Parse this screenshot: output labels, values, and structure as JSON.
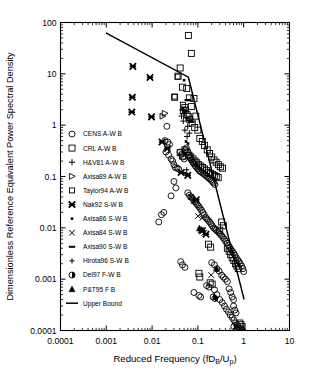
{
  "chart_data": {
    "type": "scatter",
    "title": "",
    "xlabel": "Reduced Frequency (fDB/Up)",
    "xlabel_main": "Reduced Frequency (fD",
    "xlabel_sub1": "B",
    "xlabel_mid": "/U",
    "xlabel_sub2": "p",
    "xlabel_end": ")",
    "ylabel": "Dimensionless Reference Equivalent Power Spectral Density",
    "xscale": "log",
    "yscale": "log",
    "xlim": [
      0.0001,
      10
    ],
    "ylim": [
      0.0001,
      100
    ],
    "grid": false,
    "legend_position": "inside-left",
    "xticks": [
      "0.0001",
      "0.001",
      "0.01",
      "0.1",
      "1",
      "10"
    ],
    "xtick_values": [
      0.0001,
      0.001,
      0.01,
      0.1,
      1,
      10
    ],
    "yticks": [
      "100",
      "10",
      "1",
      "0.1",
      "0.01",
      "0.001",
      "0.0001"
    ],
    "ytick_values": [
      100,
      10,
      1,
      0.1,
      0.01,
      0.001,
      0.0001
    ],
    "series": [
      {
        "name": "CENS A-W B",
        "marker": "circle-open",
        "points": [
          [
            0.021,
            0.95
          ],
          [
            0.019,
            0.5
          ],
          [
            0.022,
            0.47
          ],
          [
            0.024,
            0.42
          ],
          [
            0.02,
            0.3
          ],
          [
            0.023,
            0.26
          ],
          [
            0.026,
            0.22
          ],
          [
            0.028,
            0.2
          ],
          [
            0.03,
            0.17
          ],
          [
            0.032,
            0.15
          ],
          [
            0.035,
            0.145
          ],
          [
            0.038,
            0.14
          ],
          [
            0.041,
            0.3
          ],
          [
            0.044,
            0.27
          ],
          [
            0.047,
            0.24
          ],
          [
            0.05,
            0.22
          ],
          [
            0.053,
            0.33
          ],
          [
            0.056,
            0.36
          ],
          [
            0.06,
            0.3
          ],
          [
            0.064,
            0.26
          ],
          [
            0.068,
            0.23
          ],
          [
            0.072,
            0.21
          ],
          [
            0.077,
            0.19
          ],
          [
            0.082,
            0.175
          ],
          [
            0.088,
            0.16
          ],
          [
            0.094,
            0.15
          ],
          [
            0.1,
            0.14
          ],
          [
            0.107,
            0.13
          ],
          [
            0.114,
            0.125
          ],
          [
            0.122,
            0.12
          ],
          [
            0.13,
            0.115
          ],
          [
            0.139,
            0.11
          ],
          [
            0.148,
            0.105
          ],
          [
            0.158,
            0.1
          ],
          [
            0.169,
            0.095
          ],
          [
            0.181,
            0.09
          ],
          [
            0.193,
            0.085
          ],
          [
            0.206,
            0.08
          ],
          [
            0.22,
            0.075
          ],
          [
            0.235,
            0.07
          ],
          [
            0.03,
            0.08
          ],
          [
            0.033,
            0.06
          ],
          [
            0.026,
            0.042
          ],
          [
            0.018,
            0.02
          ],
          [
            0.016,
            0.018
          ],
          [
            0.014,
            0.013
          ],
          [
            0.06,
            0.048
          ],
          [
            0.065,
            0.043
          ],
          [
            0.07,
            0.04
          ],
          [
            0.075,
            0.038
          ],
          [
            0.08,
            0.035
          ],
          [
            0.086,
            0.032
          ],
          [
            0.092,
            0.03
          ],
          [
            0.098,
            0.028
          ],
          [
            0.105,
            0.026
          ],
          [
            0.112,
            0.024
          ],
          [
            0.12,
            0.022
          ],
          [
            0.128,
            0.02
          ],
          [
            0.137,
            0.018
          ],
          [
            0.147,
            0.016
          ],
          [
            0.157,
            0.015
          ],
          [
            0.168,
            0.014
          ],
          [
            0.18,
            0.013
          ],
          [
            0.193,
            0.012
          ],
          [
            0.206,
            0.011
          ],
          [
            0.22,
            0.01
          ],
          [
            0.236,
            0.0095
          ],
          [
            0.252,
            0.009
          ],
          [
            0.27,
            0.0085
          ],
          [
            0.288,
            0.008
          ],
          [
            0.308,
            0.0075
          ],
          [
            0.33,
            0.007
          ],
          [
            0.353,
            0.0065
          ],
          [
            0.377,
            0.006
          ],
          [
            0.403,
            0.0055
          ],
          [
            0.431,
            0.005
          ],
          [
            0.461,
            0.0046
          ],
          [
            0.493,
            0.0042
          ],
          [
            0.527,
            0.0038
          ],
          [
            0.564,
            0.0035
          ],
          [
            0.603,
            0.0032
          ],
          [
            0.645,
            0.0029
          ],
          [
            0.69,
            0.0026
          ],
          [
            0.737,
            0.0024
          ],
          [
            0.788,
            0.0022
          ],
          [
            0.843,
            0.002
          ],
          [
            0.901,
            0.0018
          ],
          [
            0.963,
            0.0016
          ],
          [
            1.0,
            0.0014
          ],
          [
            0.042,
            0.0022
          ],
          [
            0.046,
            0.0019
          ],
          [
            0.052,
            0.0017
          ],
          [
            0.082,
            0.00055
          ],
          [
            0.105,
            0.00048
          ],
          [
            0.115,
            0.00045
          ],
          [
            0.155,
            0.00075
          ],
          [
            0.175,
            0.0007
          ],
          [
            0.23,
            0.00062
          ],
          [
            0.26,
            0.0005
          ],
          [
            0.3,
            0.0004
          ],
          [
            0.34,
            0.00035
          ],
          [
            0.38,
            0.0003
          ],
          [
            0.42,
            0.00026
          ],
          [
            0.465,
            0.00023
          ],
          [
            0.51,
            0.0002
          ],
          [
            0.56,
            0.00018
          ],
          [
            0.61,
            0.00016
          ],
          [
            0.66,
            0.00014
          ],
          [
            0.71,
            0.00013
          ],
          [
            0.76,
            0.00012
          ],
          [
            0.81,
            0.00011
          ],
          [
            0.86,
            0.000105
          ],
          [
            0.91,
            0.0001
          ],
          [
            0.95,
            0.0001
          ],
          [
            0.6,
            0.0003
          ],
          [
            0.64,
            0.00025
          ],
          [
            0.68,
            0.00022
          ],
          [
            0.56,
            0.00045
          ],
          [
            0.6,
            0.0004
          ],
          [
            0.52,
            0.00055
          ],
          [
            0.48,
            0.00065
          ],
          [
            0.33,
            0.0012
          ],
          [
            0.36,
            0.0011
          ],
          [
            0.4,
            0.001
          ],
          [
            0.44,
            0.0009
          ],
          [
            0.26,
            0.0016
          ],
          [
            0.29,
            0.00145
          ],
          [
            0.2,
            0.0021
          ],
          [
            0.23,
            0.0019
          ]
        ]
      },
      {
        "name": "CRL A-W B",
        "marker": "square-open",
        "points": [
          [
            0.062,
            56
          ],
          [
            0.072,
            25
          ],
          [
            0.041,
            13
          ],
          [
            0.037,
            9.0
          ],
          [
            0.046,
            5.5
          ],
          [
            0.057,
            5.2
          ],
          [
            0.031,
            3.5
          ],
          [
            0.065,
            3.4
          ],
          [
            0.082,
            3.3
          ],
          [
            0.072,
            2.3
          ],
          [
            0.052,
            2.2
          ],
          [
            0.048,
            1.9
          ],
          [
            0.058,
            1.6
          ],
          [
            0.09,
            1.5
          ],
          [
            0.066,
            1.3
          ],
          [
            0.075,
            1.1
          ],
          [
            0.085,
            0.9
          ],
          [
            0.1,
            0.8
          ],
          [
            0.11,
            0.55
          ],
          [
            0.125,
            0.48
          ],
          [
            0.14,
            0.4
          ],
          [
            0.16,
            0.33
          ],
          [
            0.18,
            0.28
          ],
          [
            0.2,
            0.24
          ],
          [
            0.225,
            0.21
          ],
          [
            0.25,
            0.19
          ],
          [
            0.28,
            0.17
          ],
          [
            0.31,
            0.155
          ],
          [
            0.345,
            0.145
          ],
          [
            0.041,
            0.29
          ],
          [
            0.046,
            0.25
          ],
          [
            0.052,
            0.33
          ],
          [
            0.058,
            0.3
          ],
          [
            0.064,
            0.26
          ],
          [
            0.07,
            0.24
          ],
          [
            0.078,
            0.22
          ],
          [
            0.086,
            0.2
          ],
          [
            0.094,
            0.185
          ],
          [
            0.104,
            0.17
          ],
          [
            0.115,
            0.16
          ],
          [
            0.127,
            0.15
          ],
          [
            0.14,
            0.14
          ],
          [
            0.155,
            0.13
          ],
          [
            0.17,
            0.12
          ],
          [
            0.188,
            0.115
          ],
          [
            0.207,
            0.11
          ],
          [
            0.228,
            0.105
          ],
          [
            0.252,
            0.1
          ],
          [
            0.278,
            0.095
          ],
          [
            0.33,
            0.013
          ],
          [
            0.36,
            0.011
          ],
          [
            0.3,
            0.009
          ],
          [
            0.17,
            0.0048
          ],
          [
            0.19,
            0.0042
          ],
          [
            0.105,
            0.0013
          ],
          [
            0.11,
            0.0011
          ],
          [
            0.185,
            0.00085
          ],
          [
            0.205,
            0.0008
          ],
          [
            0.44,
            0.004
          ],
          [
            0.48,
            0.0035
          ],
          [
            0.52,
            0.003
          ],
          [
            0.56,
            0.0026
          ],
          [
            0.61,
            0.0023
          ],
          [
            0.66,
            0.002
          ],
          [
            0.71,
            0.0018
          ],
          [
            0.76,
            0.0016
          ],
          [
            0.82,
            0.00014
          ],
          [
            0.87,
            0.00013
          ],
          [
            0.92,
            0.00012
          ]
        ]
      },
      {
        "name": "H&V81 A-W B",
        "marker": "plus",
        "points": [
          [
            0.046,
            2.0
          ],
          [
            0.05,
            1.7
          ],
          [
            0.044,
            1.5
          ],
          [
            0.055,
            1.4
          ],
          [
            0.048,
            1.2
          ],
          [
            0.06,
            0.95
          ],
          [
            0.052,
            0.8
          ],
          [
            0.065,
            0.7
          ],
          [
            0.058,
            0.6
          ]
        ]
      },
      {
        "name": "Axisa89 A-W B",
        "marker": "triangle-right-open",
        "points": [
          [
            0.019,
            1.7
          ],
          [
            0.017,
            1.5
          ]
        ]
      },
      {
        "name": "Taylor94 A-W B",
        "marker": "square-open-small",
        "points": [
          [
            0.036,
            8.8
          ],
          [
            0.031,
            3.6
          ],
          [
            0.047,
            2.5
          ],
          [
            0.055,
            2.0
          ],
          [
            0.063,
            1.5
          ]
        ]
      },
      {
        "name": "Nak92 S-W B",
        "marker": "star-filled",
        "points": [
          [
            0.0038,
            14
          ],
          [
            0.009,
            8.5
          ],
          [
            0.0037,
            3.5
          ],
          [
            0.0036,
            1.8
          ],
          [
            0.0097,
            1.45
          ],
          [
            0.0165,
            0.47
          ],
          [
            0.0215,
            0.35
          ],
          [
            0.043,
            0.12
          ],
          [
            0.06,
            0.105
          ],
          [
            0.092,
            0.035
          ],
          [
            0.125,
            0.0088
          ],
          [
            0.15,
            0.0075
          ]
        ]
      },
      {
        "name": "Axisa86 S-W B",
        "marker": "dot-small",
        "points": [
          [
            0.05,
            7.5
          ],
          [
            0.055,
            0.48
          ],
          [
            0.061,
            0.44
          ]
        ]
      },
      {
        "name": "Axisa84 S-W B",
        "marker": "x-cross",
        "points": [
          [
            0.1,
            0.017
          ],
          [
            0.125,
            0.0155
          ],
          [
            0.138,
            0.008
          ],
          [
            0.115,
            0.009
          ],
          [
            0.195,
            0.0012
          ],
          [
            0.07,
            0.04
          ],
          [
            0.08,
            0.033
          ]
        ]
      },
      {
        "name": "Axisa90 S-W B",
        "marker": "dash",
        "points": [
          [
            0.06,
            3.1
          ],
          [
            0.066,
            1.25
          ],
          [
            0.072,
            1.15
          ],
          [
            0.052,
            0.115
          ]
        ]
      },
      {
        "name": "Hirota96 S-W B",
        "marker": "plus-small",
        "points": [
          [
            0.047,
            1.95
          ],
          [
            0.052,
            1.85
          ],
          [
            0.057,
            0.135
          ]
        ]
      },
      {
        "name": "Del97 F-W B",
        "marker": "circle-half-filled",
        "points": [
          [
            0.215,
            0.00045
          ],
          [
            0.235,
            0.00042
          ],
          [
            0.61,
            0.00012
          ]
        ]
      },
      {
        "name": "P&T95 F B",
        "marker": "triangle-up-filled",
        "points": [
          [
            0.108,
            0.0098
          ],
          [
            0.122,
            0.0092
          ],
          [
            0.255,
            0.0016
          ]
        ]
      }
    ],
    "upper_bound": {
      "label": "Upper Bound",
      "style": "solid-line",
      "vertices": [
        [
          0.00098,
          63.0
        ],
        [
          0.062,
          8.6
        ],
        [
          1.02,
          0.0004
        ]
      ]
    }
  },
  "legend": {
    "entries": [
      {
        "label": "CENS A-W B",
        "marker": "circle-open"
      },
      {
        "label": "CRL A-W B",
        "marker": "square-open"
      },
      {
        "label": "H&V81 A-W B",
        "marker": "plus"
      },
      {
        "label": "Axisa89 A-W B",
        "marker": "triangle-right-open"
      },
      {
        "label": "Taylor94 A-W B",
        "marker": "square-open-small"
      },
      {
        "label": "Nak92 S-W B",
        "marker": "star-filled"
      },
      {
        "label": "Axisa86 S-W B",
        "marker": "dot-small"
      },
      {
        "label": "Axisa84 S-W B",
        "marker": "x-cross"
      },
      {
        "label": "Axisa90 S-W B",
        "marker": "dash"
      },
      {
        "label": "Hirota96 S-W B",
        "marker": "plus-small"
      },
      {
        "label": "Del97 F-W B",
        "marker": "circle-half-filled"
      },
      {
        "label": "P&T95 F B",
        "marker": "triangle-up-filled"
      },
      {
        "label": "Upper Bound",
        "marker": "line"
      }
    ]
  },
  "colors": {
    "ink": "#000000",
    "background": "#ffffff"
  }
}
